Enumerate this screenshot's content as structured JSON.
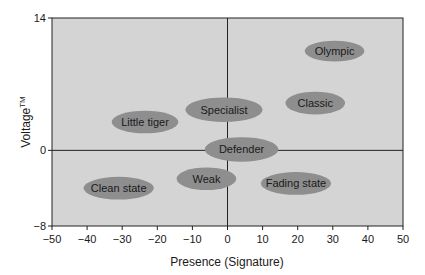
{
  "chart_data": {
    "type": "scatter",
    "title": "",
    "xlabel": "Presence (Signature)",
    "ylabel": "Voltage",
    "ylabel_superscript": "TM",
    "xlim": [
      -50,
      50
    ],
    "ylim": [
      -8,
      14
    ],
    "x_ticks": [
      -50,
      -40,
      -30,
      -20,
      -10,
      0,
      10,
      20,
      30,
      40,
      50
    ],
    "y_ticks": [
      -8,
      0,
      14
    ],
    "grid": false,
    "legend": "none",
    "quadrant_lines": {
      "x": 0,
      "y": 0
    },
    "colors": {
      "plot_bg": "#d4d4d4",
      "ellipse": "#8e8e8e",
      "axis": "#222222"
    },
    "points": [
      {
        "label": "Olympic",
        "x": 30.5,
        "y": 10.5,
        "rx": 8.5,
        "ry": 1.1
      },
      {
        "label": "Classic",
        "x": 25,
        "y": 5,
        "rx": 8.5,
        "ry": 1.2
      },
      {
        "label": "Specialist",
        "x": -1,
        "y": 4.3,
        "rx": 11,
        "ry": 1.3
      },
      {
        "label": "Little tiger",
        "x": -23.5,
        "y": 3,
        "rx": 9.5,
        "ry": 1.2
      },
      {
        "label": "Defender",
        "x": 4,
        "y": 0.1,
        "rx": 10.5,
        "ry": 1.3
      },
      {
        "label": "Weak",
        "x": -6,
        "y": -3,
        "rx": 8.5,
        "ry": 1.2
      },
      {
        "label": "Fading state",
        "x": 19.5,
        "y": -3.5,
        "rx": 10,
        "ry": 1.2
      },
      {
        "label": "Clean state",
        "x": -31,
        "y": -4,
        "rx": 10,
        "ry": 1.2
      }
    ]
  }
}
